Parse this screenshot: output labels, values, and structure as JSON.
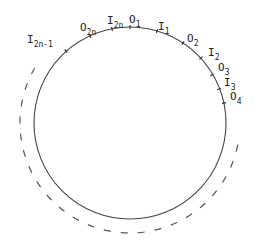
{
  "diagram": {
    "type": "circle-with-labeled-points",
    "circle": {
      "cx": 130,
      "cy": 123,
      "r": 96,
      "stroke": "#444444"
    },
    "dashed_arc": {
      "cx": 130,
      "cy": 123,
      "r": 110,
      "stroke": "#555555",
      "from_deg": -60,
      "to_deg": 100,
      "direction": "clockwise-via-bottom",
      "note": "drawn outside the circle from upper-left around bottom to right"
    },
    "points": [
      {
        "id": "O1",
        "base": "O",
        "sub": "1",
        "tick": [
          130,
          27
        ],
        "label_xy": [
          129,
          23
        ]
      },
      {
        "id": "I1",
        "base": "I",
        "sub": "1",
        "tick": [
          157,
          31
        ],
        "label_xy": [
          158,
          30
        ]
      },
      {
        "id": "O2",
        "base": "O",
        "sub": "2",
        "tick": [
          183,
          43
        ],
        "label_xy": [
          187,
          42
        ]
      },
      {
        "id": "I2",
        "base": "I",
        "sub": "2",
        "tick": [
          201,
          58
        ],
        "label_xy": [
          208,
          56
        ]
      },
      {
        "id": "O3",
        "base": "O",
        "sub": "3",
        "tick": [
          212,
          75
        ],
        "label_xy": [
          218,
          71
        ]
      },
      {
        "id": "I3",
        "base": "I",
        "sub": "3",
        "tick": [
          219,
          89
        ],
        "label_xy": [
          224,
          86
        ]
      },
      {
        "id": "O4",
        "base": "O",
        "sub": "4",
        "tick": [
          224,
          103
        ],
        "label_xy": [
          230,
          100
        ]
      },
      {
        "id": "I2n",
        "base": "I",
        "sub": "2n",
        "tick": [
          112,
          29
        ],
        "label_xy": [
          107,
          24
        ]
      },
      {
        "id": "O2n",
        "base": "O",
        "sub": "2n",
        "tick": [
          90,
          36
        ],
        "label_xy": [
          80,
          31
        ]
      },
      {
        "id": "I2n-1",
        "base": "I",
        "sub": "2n-1",
        "tick": [
          66,
          51
        ],
        "label_xy": [
          27,
          43
        ]
      }
    ]
  }
}
